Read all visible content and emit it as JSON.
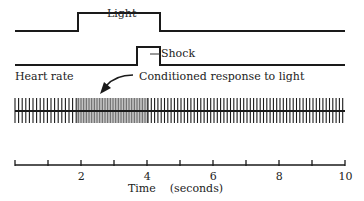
{
  "diagram": {
    "traces": [
      {
        "name": "Light",
        "label": "Light",
        "baseline_y": 31,
        "high_y": 13,
        "on_x": 78,
        "off_x": 160
      },
      {
        "name": "Shock",
        "label": "Shock",
        "baseline_y": 65,
        "high_y": 47,
        "on_x": 137,
        "off_x": 160
      }
    ],
    "heart_rate": {
      "label": "Heart rate",
      "annotation": "Conditioned response to light",
      "segments": [
        {
          "from_x": 15,
          "to_x": 77,
          "spacing": 3.6,
          "description": "baseline rate"
        },
        {
          "from_x": 77,
          "to_x": 148,
          "spacing": 1.6,
          "description": "accelerated rate (conditioned response)"
        },
        {
          "from_x": 148,
          "to_x": 345,
          "spacing": 3.3,
          "description": "return toward baseline"
        }
      ]
    },
    "time_axis": {
      "title": "Time    (seconds)",
      "min": 0,
      "max": 10,
      "tick_every": 1,
      "labels": [
        "2",
        "4",
        "6",
        "8",
        "10"
      ]
    }
  },
  "colors": {
    "ink": "#1a1a1a",
    "background": "#ffffff"
  }
}
